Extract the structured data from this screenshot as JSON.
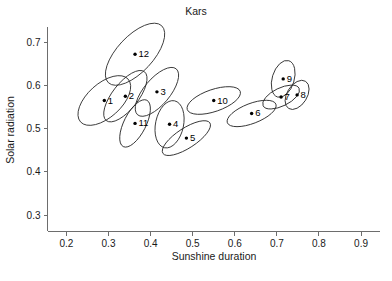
{
  "chart_data": {
    "type": "scatter",
    "title": "Kars",
    "xlabel": "Sunshine duration",
    "ylabel": "Solar radiation",
    "xlim": [
      0.155,
      0.945
    ],
    "ylim": [
      0.262,
      0.735
    ],
    "xticks": [
      "0.2",
      "0.3",
      "0.4",
      "0.5",
      "0.6",
      "0.7",
      "0.8",
      "0.9"
    ],
    "xtick_values": [
      0.2,
      0.3,
      0.4,
      0.5,
      0.6,
      0.7,
      0.8,
      0.9
    ],
    "yticks": [
      "0.3",
      "0.4",
      "0.5",
      "0.6",
      "0.7"
    ],
    "ytick_values": [
      0.3,
      0.4,
      0.5,
      0.6,
      0.7
    ],
    "grid": false,
    "legend": "none",
    "annotation_note": "Each numbered point is enclosed by a confidence ellipse; numbers 1-12 denote months.",
    "points": [
      {
        "label": "1",
        "x": 0.29,
        "y": 0.565,
        "rx": 32,
        "ry": 17,
        "angle": -42
      },
      {
        "label": "2",
        "x": 0.34,
        "y": 0.575,
        "rx": 31,
        "ry": 13,
        "angle": -52
      },
      {
        "label": "3",
        "x": 0.415,
        "y": 0.585,
        "rx": 30,
        "ry": 13,
        "angle": -50
      },
      {
        "label": "4",
        "x": 0.445,
        "y": 0.51,
        "rx": 24,
        "ry": 14,
        "angle": -78
      },
      {
        "label": "5",
        "x": 0.485,
        "y": 0.478,
        "rx": 28,
        "ry": 10,
        "angle": -33
      },
      {
        "label": "6",
        "x": 0.64,
        "y": 0.535,
        "rx": 26,
        "ry": 10,
        "angle": -21
      },
      {
        "label": "7",
        "x": 0.71,
        "y": 0.573,
        "rx": 20,
        "ry": 9,
        "angle": -26
      },
      {
        "label": "8",
        "x": 0.748,
        "y": 0.578,
        "rx": 16,
        "ry": 10,
        "angle": -58
      },
      {
        "label": "9",
        "x": 0.715,
        "y": 0.615,
        "rx": 19,
        "ry": 11,
        "angle": -73
      },
      {
        "label": "10",
        "x": 0.55,
        "y": 0.565,
        "rx": 28,
        "ry": 11,
        "angle": -19
      },
      {
        "label": "11",
        "x": 0.363,
        "y": 0.512,
        "rx": 26,
        "ry": 11,
        "angle": -63
      },
      {
        "label": "12",
        "x": 0.363,
        "y": 0.672,
        "rx": 39,
        "ry": 18,
        "angle": -47
      }
    ]
  }
}
